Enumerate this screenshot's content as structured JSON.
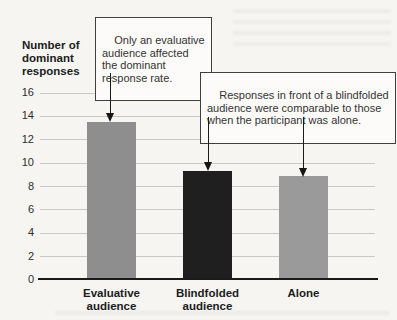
{
  "figure": {
    "y_axis_title": "Number of\ndominant\nresponses",
    "callouts": [
      {
        "text": "Only an evaluative\naudience affected\nthe dominant\nresponse rate."
      },
      {
        "text": "Responses in front of a blindfolded\naudience were comparable to those\nwhen the participant was alone."
      }
    ]
  },
  "chart_data": {
    "type": "bar",
    "title": "",
    "xlabel": "",
    "ylabel": "Number of dominant responses",
    "categories": [
      "Evaluative\naudience",
      "Blindfolded\naudience",
      "Alone"
    ],
    "values": [
      13.5,
      9.3,
      8.9
    ],
    "bar_colors": [
      "#8e8e8e",
      "#1f1f1f",
      "#9a9a9a"
    ],
    "ylim": [
      0,
      16
    ],
    "yticks": [
      0,
      2,
      4,
      6,
      8,
      10,
      12,
      14,
      16
    ],
    "grid": true,
    "legend": "none",
    "annotations": [
      {
        "text": "Only an evaluative audience affected the dominant response rate.",
        "targets": [
          "Evaluative audience"
        ]
      },
      {
        "text": "Responses in front of a blindfolded audience were comparable to those when the participant was alone.",
        "targets": [
          "Blindfolded audience",
          "Alone"
        ]
      }
    ]
  }
}
